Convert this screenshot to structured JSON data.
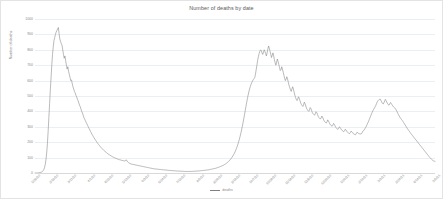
{
  "chart_data": {
    "type": "line",
    "title": "Number of deaths by date",
    "xlabel": "",
    "ylabel": "Number of deaths",
    "ylim": [
      0,
      1000
    ],
    "ytick_labels": [
      "1000",
      "900",
      "800",
      "700",
      "600",
      "500",
      "400",
      "300",
      "200",
      "100",
      "0"
    ],
    "ytick_values": [
      1000,
      900,
      800,
      700,
      600,
      500,
      400,
      300,
      200,
      100,
      0
    ],
    "grid": true,
    "legend_position": "bottom-center",
    "series": [
      {
        "name": "deaths",
        "color": "#808080",
        "values": [
          0,
          0,
          0,
          0,
          1,
          1,
          2,
          3,
          4,
          6,
          9,
          14,
          22,
          35,
          55,
          85,
          130,
          190,
          270,
          360,
          450,
          540,
          620,
          700,
          770,
          820,
          860,
          880,
          900,
          915,
          925,
          935,
          945,
          905,
          870,
          855,
          840,
          830,
          800,
          770,
          745,
          760,
          730,
          700,
          675,
          690,
          660,
          640,
          620,
          600,
          605,
          580,
          560,
          545,
          530,
          520,
          505,
          495,
          480,
          470,
          455,
          440,
          430,
          415,
          400,
          390,
          375,
          360,
          350,
          340,
          330,
          320,
          310,
          300,
          290,
          280,
          270,
          262,
          252,
          244,
          236,
          228,
          220,
          213,
          206,
          199,
          192,
          186,
          180,
          174,
          168,
          163,
          158,
          153,
          148,
          144,
          140,
          136,
          132,
          128,
          124,
          121,
          118,
          115,
          112,
          109,
          106,
          104,
          101,
          99,
          97,
          95,
          93,
          91,
          89,
          88,
          86,
          85,
          83,
          82,
          81,
          80,
          79,
          78,
          80,
          86,
          78,
          72,
          68,
          64,
          62,
          60,
          58,
          57,
          56,
          55,
          54,
          53,
          52,
          51,
          50,
          49,
          48,
          47,
          46,
          45,
          44,
          43,
          42,
          41,
          40,
          39,
          38,
          37,
          36,
          35,
          34,
          33,
          32,
          31,
          30,
          29,
          28,
          27,
          27,
          26,
          26,
          25,
          25,
          24,
          24,
          23,
          23,
          22,
          22,
          21,
          21,
          20,
          20,
          19,
          19,
          18,
          18,
          17,
          17,
          16,
          16,
          16,
          15,
          15,
          15,
          14,
          14,
          14,
          13,
          13,
          13,
          12,
          12,
          12,
          12,
          11,
          11,
          11,
          11,
          10,
          10,
          10,
          10,
          10,
          10,
          10,
          10,
          10,
          10,
          11,
          11,
          11,
          11,
          12,
          12,
          12,
          13,
          13,
          13,
          14,
          14,
          15,
          15,
          16,
          16,
          17,
          17,
          18,
          18,
          19,
          20,
          20,
          21,
          22,
          23,
          24,
          25,
          26,
          27,
          28,
          29,
          30,
          32,
          33,
          35,
          36,
          38,
          40,
          42,
          44,
          46,
          48,
          50,
          53,
          56,
          59,
          62,
          66,
          70,
          74,
          79,
          84,
          90,
          96,
          103,
          110,
          118,
          127,
          137,
          148,
          160,
          173,
          187,
          203,
          220,
          238,
          258,
          279,
          302,
          326,
          352,
          378,
          405,
          432,
          458,
          483,
          506,
          527,
          546,
          562,
          576,
          588,
          598,
          606,
          612,
          620,
          640,
          670,
          700,
          730,
          755,
          775,
          790,
          800,
          795,
          780,
          770,
          785,
          800,
          790,
          775,
          760,
          780,
          805,
          825,
          810,
          790,
          770,
          750,
          765,
          780,
          760,
          735,
          715,
          700,
          720,
          740,
          725,
          705,
          685,
          665,
          670,
          690,
          675,
          655,
          635,
          615,
          600,
          610,
          625,
          610,
          590,
          570,
          555,
          540,
          530,
          545,
          560,
          545,
          525,
          505,
          490,
          478,
          470,
          480,
          495,
          485,
          470,
          455,
          445,
          438,
          432,
          445,
          460,
          450,
          435,
          420,
          412,
          405,
          400,
          410,
          425,
          418,
          405,
          392,
          385,
          380,
          375,
          385,
          398,
          392,
          380,
          368,
          360,
          355,
          350,
          358,
          370,
          362,
          350,
          340,
          333,
          328,
          324,
          332,
          345,
          338,
          328,
          318,
          312,
          307,
          303,
          310,
          322,
          316,
          306,
          297,
          291,
          286,
          283,
          290,
          300,
          296,
          288,
          280,
          275,
          271,
          268,
          274,
          284,
          280,
          272,
          265,
          261,
          258,
          256,
          262,
          272,
          268,
          262,
          256,
          253,
          250,
          248,
          254,
          264,
          262,
          258,
          255,
          254,
          253,
          254,
          260,
          270,
          275,
          280,
          288,
          296,
          305,
          315,
          325,
          336,
          348,
          360,
          372,
          384,
          395,
          405,
          414,
          422,
          430,
          440,
          452,
          463,
          470,
          475,
          478,
          480,
          470,
          460,
          452,
          448,
          455,
          468,
          478,
          470,
          460,
          450,
          444,
          440,
          448,
          458,
          452,
          444,
          436,
          430,
          426,
          422,
          416,
          408,
          398,
          388,
          378,
          370,
          362,
          355,
          348,
          342,
          335,
          328,
          320,
          312,
          305,
          298,
          290,
          283,
          276,
          270,
          263,
          256,
          250,
          244,
          238,
          232,
          226,
          220,
          214,
          208,
          202,
          196,
          190,
          184,
          178,
          172,
          166,
          160,
          154,
          148,
          142,
          136,
          130,
          124,
          118,
          112,
          106,
          100,
          95,
          90,
          86,
          82,
          79,
          77,
          75
        ]
      }
    ],
    "xtick_labels": [
      "1/29/20",
      "2/19/20",
      "3/11/20",
      "4/1/20",
      "4/22/20",
      "5/13/20",
      "6/3/20",
      "6/24/20",
      "7/15/20",
      "8/5/20",
      "8/26/20",
      "9/16/20",
      "10/7/20",
      "10/28/20",
      "11/18/20",
      "12/9/20",
      "12/30/20",
      "1/20/21",
      "2/10/21",
      "3/3/21",
      "3/24/21",
      "4/14/21",
      "5/5/21"
    ]
  },
  "legend": {
    "label": "deaths"
  }
}
